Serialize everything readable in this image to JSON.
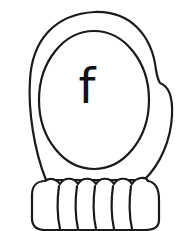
{
  "illustration": {
    "subject": "mitten",
    "letter": "f",
    "stroke_color": "#1a1a1a",
    "fill_color": "#ffffff",
    "cuff_segments": 6
  }
}
